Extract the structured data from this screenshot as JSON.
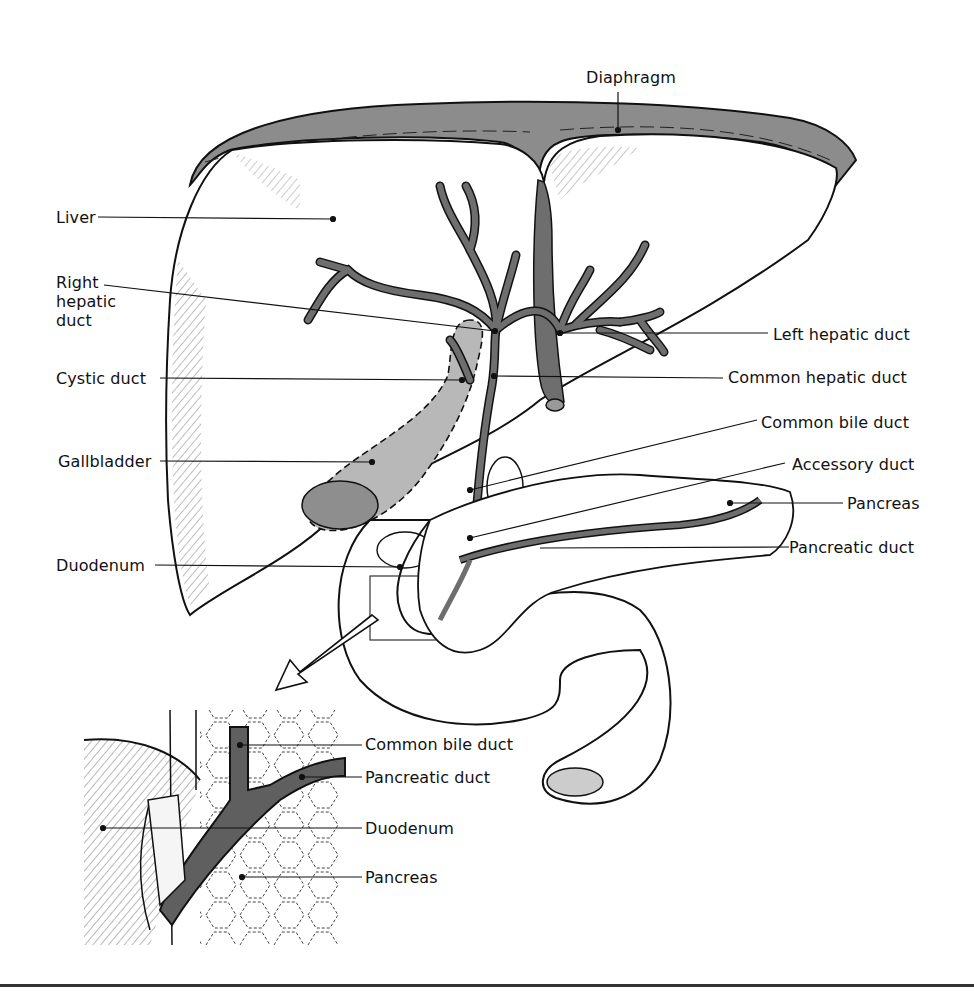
{
  "diagram": {
    "main_labels": {
      "diaphragm": "Diaphragm",
      "liver": "Liver",
      "right_hepatic_duct_line1": "Right",
      "right_hepatic_duct_line2": "hepatic",
      "right_hepatic_duct_line3": "duct",
      "cystic_duct": "Cystic duct",
      "gallbladder": "Gallbladder",
      "duodenum": "Duodenum",
      "left_hepatic_duct": "Left hepatic duct",
      "common_hepatic_duct": "Common hepatic duct",
      "common_bile_duct": "Common bile duct",
      "accessory_duct": "Accessory duct",
      "pancreas": "Pancreas",
      "pancreatic_duct": "Pancreatic duct"
    },
    "inset_labels": {
      "common_bile_duct": "Common bile duct",
      "pancreatic_duct": "Pancreatic duct",
      "duodenum": "Duodenum",
      "pancreas": "Pancreas"
    },
    "colors": {
      "line": "#111111",
      "duct_fill": "#6e6e6e",
      "gallbladder_fill": "#b8b8b8",
      "diaphragm_fill": "#8c8c8c"
    }
  }
}
